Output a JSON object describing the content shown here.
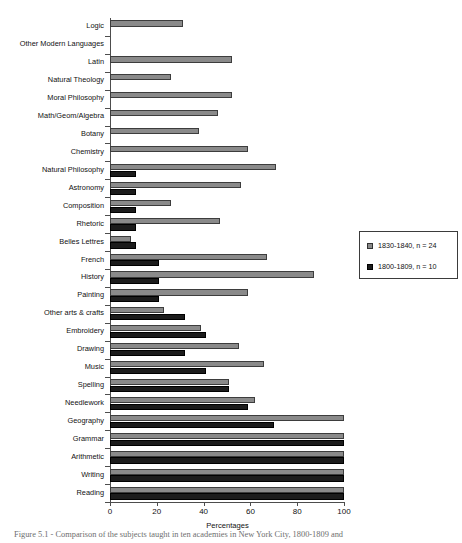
{
  "chart_data": {
    "type": "bar",
    "orientation": "horizontal",
    "title": "",
    "xlabel": "Percentages",
    "ylabel": "",
    "xlim": [
      0,
      100
    ],
    "xticks": [
      0,
      20,
      40,
      60,
      80,
      100
    ],
    "grid": false,
    "legend_position": "right",
    "categories": [
      "Logic",
      "Other Modern Languages",
      "Latin",
      "Natural Theology",
      "Moral Philosophy",
      "Math/Geom/Algebra",
      "Botany",
      "Chemistry",
      "Natural Philosophy",
      "Astronomy",
      "Composition",
      "Rhetoric",
      "Belles Lettres",
      "French",
      "History",
      "Painting",
      "Other arts & crafts",
      "Embroidery",
      "Drawing",
      "Music",
      "Spelling",
      "Needlework",
      "Geography",
      "Grammar",
      "Arithmetic",
      "Writing",
      "Reading"
    ],
    "series": [
      {
        "name": "1830-1840, n = 24",
        "color": "#8a8a8a",
        "values": [
          31,
          0,
          52,
          26,
          52,
          46,
          38,
          59,
          71,
          56,
          26,
          47,
          9,
          67,
          87,
          59,
          23,
          39,
          55,
          66,
          51,
          62,
          100,
          100,
          100,
          100,
          100
        ]
      },
      {
        "name": "1800-1809, n = 10",
        "color": "#1c1c1c",
        "values": [
          0,
          0,
          0,
          0,
          0,
          0,
          0,
          0,
          11,
          11,
          11,
          11,
          11,
          21,
          21,
          21,
          32,
          41,
          32,
          41,
          51,
          59,
          70,
          100,
          100,
          100,
          100
        ]
      }
    ]
  },
  "legend": {
    "items": [
      {
        "label": "1830-1840, n = 24",
        "swatch": "s1"
      },
      {
        "label": "1800-1809, n = 10",
        "swatch": "s2"
      }
    ]
  },
  "caption": {
    "text": "Figure 5.1 - Comparison of the subjects taught in ten academies in New York City, 1800-1809 and"
  }
}
